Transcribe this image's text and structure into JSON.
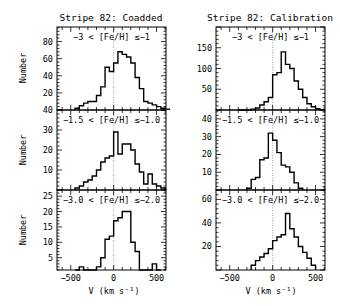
{
  "chart_data": [
    {
      "type": "bar",
      "title": "Stripe 82: Coadded",
      "xlabel": "V (km s⁻¹)",
      "ylabel": "Number",
      "xlim": [
        -660,
        610
      ],
      "xticks": [
        -500,
        0,
        500
      ],
      "panels": [
        {
          "label": "−3 < [Fe/H] ≤−1",
          "ylim": [
            0,
            97
          ],
          "yticks": [
            20,
            40,
            60,
            80
          ],
          "bin_width": 50,
          "bin_edges_start": -450,
          "values": [
            2,
            5,
            8,
            10,
            10,
            17,
            27,
            50,
            45,
            55,
            68,
            65,
            62,
            55,
            38,
            25,
            10,
            8,
            6,
            4,
            2,
            1
          ]
        },
        {
          "label": "−1.5 < [Fe/H] ≤−1.0",
          "ylim": [
            0,
            40
          ],
          "yticks": [
            10,
            20,
            30,
            40
          ],
          "bin_width": 50,
          "bin_edges_start": -450,
          "values": [
            1,
            2,
            4,
            5,
            7,
            10,
            14,
            16,
            17,
            29,
            18,
            23,
            23,
            20,
            13,
            9,
            3,
            8,
            3,
            2,
            1
          ]
        },
        {
          "label": "−3.0 < [Fe/H] ≤−2.0",
          "ylim": [
            1,
            27
          ],
          "yticks": [
            5,
            10,
            15,
            20,
            25
          ],
          "bin_width": 50,
          "bin_edges_start": -450,
          "values": [
            0,
            2,
            0,
            0,
            1,
            2,
            5,
            11,
            12,
            17,
            18,
            20,
            20,
            10,
            7,
            0,
            0,
            0,
            3,
            0
          ]
        }
      ]
    },
    {
      "type": "bar",
      "title": "Stripe 82: Calibration",
      "xlabel": "V (km s⁻¹)",
      "ylabel": "",
      "xlim": [
        -660,
        610
      ],
      "xticks": [
        -500,
        0,
        500
      ],
      "panels": [
        {
          "label": "−3 < [Fe/H] ≤−1",
          "ylim": [
            0,
            200
          ],
          "yticks": [
            50,
            100,
            150
          ],
          "bin_width": 50,
          "bin_edges_start": -400,
          "values": [
            0,
            0,
            0,
            2,
            5,
            12,
            20,
            30,
            85,
            90,
            140,
            110,
            100,
            70,
            50,
            30,
            15,
            8,
            3,
            1
          ]
        },
        {
          "label": "−1.5 < [Fe/H] ≤−1.0",
          "ylim": [
            0,
            45
          ],
          "yticks": [
            10,
            20,
            30,
            40
          ],
          "bin_width": 50,
          "bin_edges_start": -300,
          "values": [
            1,
            6,
            7,
            17,
            18,
            32,
            28,
            21,
            14,
            13,
            10,
            4,
            1
          ]
        },
        {
          "label": "−3.0 < [Fe/H] ≤−2.0",
          "ylim": [
            0,
            68
          ],
          "yticks": [
            20,
            40,
            60
          ],
          "bin_width": 50,
          "bin_edges_start": -250,
          "values": [
            4,
            8,
            11,
            14,
            18,
            25,
            28,
            30,
            48,
            35,
            28,
            20,
            15,
            10,
            4
          ]
        }
      ]
    }
  ],
  "figure": {
    "left_title": "Stripe 82: Coadded",
    "right_title": "Stripe 82: Calibration",
    "ylabel": "Number",
    "xlabel_left": "V (km s⁻¹)",
    "xlabel_right": "V (km s⁻¹)"
  }
}
